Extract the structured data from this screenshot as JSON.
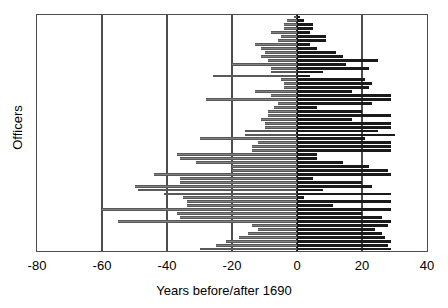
{
  "chart_data": {
    "type": "bar",
    "orientation": "horizontal",
    "subtype": "range-bar",
    "title": "",
    "xlabel": "Years before/after 1690",
    "ylabel": "Officers",
    "xlim": [
      -80,
      40
    ],
    "ylim": [
      0,
      60
    ],
    "xticks": [
      -80,
      -60,
      -40,
      -20,
      0,
      20,
      40
    ],
    "xtick_labels": [
      "-80",
      "-60",
      "-40",
      "-20",
      "0",
      "20",
      "40"
    ],
    "yticks": [],
    "ytick_labels": [],
    "grid": "vertical-major",
    "legend": "none",
    "colors": {
      "before": "#808080",
      "after": "#1a1a1a",
      "axis": "#4d4d4d",
      "zero_line": "#1a1a1a",
      "background": "#ffffff"
    },
    "categories": [
      "officer-1",
      "officer-2",
      "officer-3",
      "officer-4",
      "officer-5",
      "officer-6",
      "officer-7",
      "officer-8",
      "officer-9",
      "officer-10",
      "officer-11",
      "officer-12",
      "officer-13",
      "officer-14",
      "officer-15",
      "officer-16",
      "officer-17",
      "officer-18",
      "officer-19",
      "officer-20",
      "officer-21",
      "officer-22",
      "officer-23",
      "officer-24",
      "officer-25",
      "officer-26",
      "officer-27",
      "officer-28",
      "officer-29",
      "officer-30",
      "officer-31",
      "officer-32",
      "officer-33",
      "officer-34",
      "officer-35",
      "officer-36",
      "officer-37",
      "officer-38",
      "officer-39",
      "officer-40",
      "officer-41",
      "officer-42",
      "officer-43",
      "officer-44",
      "officer-45",
      "officer-46",
      "officer-47",
      "officer-48",
      "officer-49",
      "officer-50",
      "officer-51",
      "officer-52",
      "officer-53",
      "officer-54",
      "officer-55",
      "officer-56",
      "officer-57",
      "officer-58",
      "officer-59",
      "officer-60"
    ],
    "series": [
      {
        "name": "Years before 1690",
        "color": "#808080",
        "values": [
          -1,
          -3,
          -4,
          -4,
          -8,
          -5,
          -6,
          -13,
          -11,
          -10,
          -11,
          -9,
          -20,
          -8,
          -8,
          -26,
          -5,
          -4,
          -4,
          -13,
          -8,
          -28,
          -6,
          -7,
          -9,
          -9,
          -11,
          -10,
          -10,
          -16,
          -16,
          -30,
          -12,
          -14,
          -14,
          -37,
          -36,
          -31,
          -20,
          -20,
          -44,
          -36,
          -36,
          -50,
          -49,
          -41,
          -35,
          -34,
          -34,
          -60,
          -37,
          -36,
          -55,
          -14,
          -12,
          -15,
          -18,
          -22,
          -25,
          -30
        ]
      },
      {
        "name": "Years after 1690",
        "color": "#1a1a1a",
        "values": [
          1,
          2,
          5,
          5,
          4,
          9,
          9,
          4,
          6,
          12,
          14,
          25,
          15,
          22,
          8,
          4,
          21,
          23,
          22,
          17,
          29,
          29,
          23,
          6,
          20,
          29,
          17,
          29,
          29,
          25,
          30,
          21,
          29,
          29,
          29,
          6,
          6,
          14,
          22,
          28,
          29,
          5,
          20,
          23,
          8,
          29,
          2,
          29,
          11,
          29,
          20,
          26,
          29,
          28,
          24,
          26,
          27,
          29,
          28,
          29
        ]
      }
    ]
  },
  "axes": {
    "x_title": "Years before/after 1690",
    "y_title": "Officers",
    "x_tick_labels": [
      "-80",
      "-60",
      "-40",
      "-20",
      "0",
      "20",
      "40"
    ]
  }
}
